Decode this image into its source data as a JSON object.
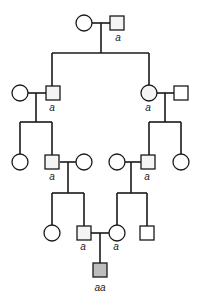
{
  "diagram": {
    "type": "pedigree",
    "colors": {
      "line": "#1a1a1a",
      "unaffected_fill": "#ffffff",
      "affected_fill": "#bdbdbd",
      "carrier_fill": "#f4f4f4"
    },
    "generations": [
      {
        "id": "I",
        "individuals": [
          {
            "id": "I-1",
            "sex": "female",
            "label": ""
          },
          {
            "id": "I-2",
            "sex": "male",
            "label": "a"
          }
        ]
      },
      {
        "id": "II",
        "individuals": [
          {
            "id": "II-1",
            "sex": "female",
            "label": ""
          },
          {
            "id": "II-2",
            "sex": "male",
            "label": "a"
          },
          {
            "id": "II-3",
            "sex": "female",
            "label": "a"
          },
          {
            "id": "II-4",
            "sex": "male",
            "label": ""
          }
        ]
      },
      {
        "id": "III",
        "individuals": [
          {
            "id": "III-1",
            "sex": "female",
            "label": ""
          },
          {
            "id": "III-2",
            "sex": "male",
            "label": "a"
          },
          {
            "id": "III-3",
            "sex": "female",
            "label": ""
          },
          {
            "id": "III-4",
            "sex": "female",
            "label": ""
          },
          {
            "id": "III-5",
            "sex": "male",
            "label": "a"
          },
          {
            "id": "III-6",
            "sex": "female",
            "label": ""
          }
        ]
      },
      {
        "id": "IV",
        "individuals": [
          {
            "id": "IV-1",
            "sex": "female",
            "label": ""
          },
          {
            "id": "IV-2",
            "sex": "male",
            "label": "a"
          },
          {
            "id": "IV-3",
            "sex": "female",
            "label": "a"
          },
          {
            "id": "IV-4",
            "sex": "male",
            "label": ""
          }
        ]
      },
      {
        "id": "V",
        "individuals": [
          {
            "id": "V-1",
            "sex": "male",
            "label": "aa",
            "affected": true
          }
        ]
      }
    ],
    "labels": {
      "i2": "a",
      "ii2": "a",
      "ii3": "a",
      "iii2": "a",
      "iii5": "a",
      "iv2": "a",
      "iv3": "a",
      "v1": "aa"
    }
  }
}
